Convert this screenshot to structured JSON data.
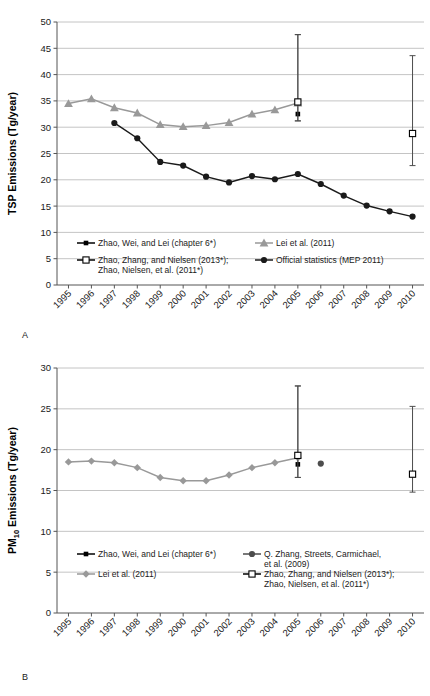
{
  "figure": {
    "panels": [
      {
        "letter": "A"
      },
      {
        "letter": "B"
      }
    ]
  },
  "chart_data": [
    {
      "type": "line",
      "panel": "A",
      "title": "",
      "xlabel": "",
      "ylabel": "TSP Emissions (Tg/year)",
      "ylim": [
        0,
        50
      ],
      "ytick_step": 5,
      "yticks": [
        "0",
        "5",
        "10",
        "15",
        "20",
        "25",
        "30",
        "35",
        "40",
        "45",
        "50"
      ],
      "grid": true,
      "legend_position": "inside-bottom",
      "categories": [
        "1995",
        "1996",
        "1997",
        "1998",
        "1999",
        "2000",
        "2001",
        "2002",
        "2003",
        "2004",
        "2005",
        "2006",
        "2007",
        "2008",
        "2009",
        "2010"
      ],
      "series": [
        {
          "name": "Zhao, Wei, and Lei (chapter 6*)",
          "marker": "filled-square",
          "color": "#000000",
          "points": [
            {
              "x": "2005",
              "y": 32.5,
              "err_low": 31.2,
              "err_high": 47.6
            }
          ]
        },
        {
          "name": "Lei et al. (2011)",
          "marker": "filled-triangle",
          "color": "#999999",
          "x": [
            "1995",
            "1996",
            "1997",
            "1998",
            "1999",
            "2000",
            "2001",
            "2002",
            "2003",
            "2004",
            "2005"
          ],
          "values": [
            34.5,
            35.4,
            33.7,
            32.7,
            30.5,
            30.1,
            30.3,
            30.9,
            32.5,
            33.3,
            34.6
          ]
        },
        {
          "name": "Zhao, Zhang, and Nielsen (2013*); Zhao, Nielsen, et al. (2011*)",
          "marker": "open-square",
          "color": "#000000",
          "points": [
            {
              "x": "2005",
              "y": 34.8,
              "err_low": 31.2,
              "err_high": 47.6
            },
            {
              "x": "2010",
              "y": 28.8,
              "err_low": 22.7,
              "err_high": 43.6
            }
          ]
        },
        {
          "name": "Official statistics (MEP 2011)",
          "marker": "filled-circle",
          "color": "#1a1a1a",
          "x": [
            "1997",
            "1998",
            "1999",
            "2000",
            "2001",
            "2002",
            "2003",
            "2004",
            "2005",
            "2006",
            "2007",
            "2008",
            "2009",
            "2010"
          ],
          "values": [
            30.8,
            27.9,
            23.4,
            22.7,
            20.6,
            19.5,
            20.7,
            20.1,
            21.1,
            19.2,
            17.0,
            15.1,
            14.0,
            13.0
          ]
        }
      ],
      "legend": [
        {
          "label": "Zhao, Wei, and Lei (chapter 6*)",
          "marker": "filled-square",
          "color": "#000000"
        },
        {
          "label": "Lei et al. (2011)",
          "marker": "filled-triangle",
          "color": "#999999"
        },
        {
          "label": "Zhao, Zhang, and Nielsen (2013*);",
          "label2": "Zhao, Nielsen, et al. (2011*)",
          "marker": "open-square",
          "color": "#000000"
        },
        {
          "label": "Official statistics (MEP 2011)",
          "marker": "filled-circle",
          "color": "#1a1a1a"
        }
      ]
    },
    {
      "type": "line",
      "panel": "B",
      "title": "",
      "xlabel": "",
      "ylabel": "PM10 Emissions (Tg/year)",
      "ylabel_main": "PM",
      "ylabel_sub": "10",
      "ylabel_rest": " Emissions (Tg/year)",
      "ylim": [
        0,
        30
      ],
      "ytick_step": 5,
      "yticks": [
        "0",
        "5",
        "10",
        "15",
        "20",
        "25",
        "30"
      ],
      "grid": true,
      "legend_position": "inside-bottom",
      "categories": [
        "1995",
        "1996",
        "1997",
        "1998",
        "1999",
        "2000",
        "2001",
        "2002",
        "2003",
        "2004",
        "2005",
        "2006",
        "2007",
        "2008",
        "2009",
        "2010"
      ],
      "series": [
        {
          "name": "Zhao, Wei, and Lei (chapter 6*)",
          "marker": "filled-square",
          "color": "#000000",
          "points": [
            {
              "x": "2005",
              "y": 18.2,
              "err_low": 16.6,
              "err_high": 27.8
            }
          ]
        },
        {
          "name": "Lei et al. (2011)",
          "marker": "filled-diamond",
          "color": "#999999",
          "x": [
            "1995",
            "1996",
            "1997",
            "1998",
            "1999",
            "2000",
            "2001",
            "2002",
            "2003",
            "2004",
            "2005"
          ],
          "values": [
            18.5,
            18.6,
            18.4,
            17.8,
            16.6,
            16.2,
            16.2,
            16.9,
            17.8,
            18.4,
            19.0
          ]
        },
        {
          "name": "Q. Zhang, Streets, Carmichael, et al. (2009)",
          "marker": "filled-circle",
          "color": "#4d4d4d",
          "points": [
            {
              "x": "2006",
              "y": 18.3
            }
          ]
        },
        {
          "name": "Zhao, Zhang, and Nielsen (2013*); Zhao, Nielsen, et al. (2011*)",
          "marker": "open-square",
          "color": "#000000",
          "points": [
            {
              "x": "2005",
              "y": 19.3,
              "err_low": 16.6,
              "err_high": 27.8
            },
            {
              "x": "2010",
              "y": 17.0,
              "err_low": 14.8,
              "err_high": 25.3
            }
          ]
        }
      ],
      "legend": [
        {
          "label": "Zhao, Wei, and Lei (chapter 6*)",
          "marker": "filled-square",
          "color": "#000000"
        },
        {
          "label": "Q. Zhang, Streets, Carmichael,",
          "label2": "et al. (2009)",
          "marker": "filled-circle",
          "color": "#4d4d4d"
        },
        {
          "label": "Lei et al. (2011)",
          "marker": "filled-diamond",
          "color": "#999999"
        },
        {
          "label": "Zhao, Zhang, and Nielsen (2013*);",
          "label2": "Zhao, Nielsen, et al. (2011*)",
          "marker": "open-square",
          "color": "#000000"
        }
      ]
    }
  ]
}
